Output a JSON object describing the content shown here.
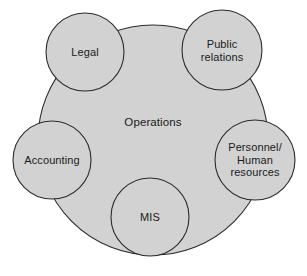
{
  "diagram": {
    "type": "venn-cluster",
    "colors": {
      "node_fill": "#d2d2d2",
      "node_stroke": "#2b2b2b",
      "background": "#ffffff",
      "text": "#1a1a1a"
    },
    "center": {
      "id": "operations",
      "label": "Operations",
      "shape": "circle",
      "cx": 153,
      "cy": 140,
      "r": 115,
      "label_x": 153,
      "label_y": 122
    },
    "satellites": [
      {
        "id": "legal",
        "label": "Legal",
        "shape": "circle",
        "cx": 85,
        "cy": 52,
        "r": 39,
        "lines": [
          "Legal"
        ]
      },
      {
        "id": "public-relations",
        "label": "Public relations",
        "shape": "circle",
        "cx": 222,
        "cy": 50,
        "r": 40,
        "lines": [
          "Public",
          "relations"
        ]
      },
      {
        "id": "personnel-human-resources",
        "label": "Personnel/ Human resources",
        "shape": "circle",
        "cx": 255,
        "cy": 160,
        "r": 40,
        "lines": [
          "Personnel/",
          "Human",
          "resources"
        ]
      },
      {
        "id": "mis",
        "label": "MIS",
        "shape": "circle",
        "cx": 150,
        "cy": 217,
        "r": 39,
        "lines": [
          "MIS"
        ]
      },
      {
        "id": "accounting",
        "label": "Accounting",
        "shape": "circle",
        "cx": 52,
        "cy": 160,
        "r": 39,
        "lines": [
          "Accounting"
        ]
      }
    ]
  }
}
